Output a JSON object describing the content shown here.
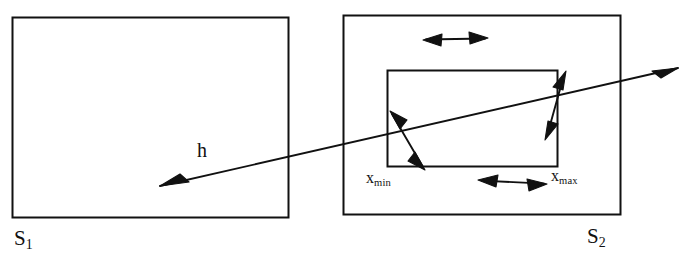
{
  "figure": {
    "type": "diagram",
    "background_color": "#ffffff",
    "stroke_color": "#111111",
    "width": 695,
    "height": 262
  },
  "labels": {
    "s1": {
      "base": "S",
      "subscript": "1"
    },
    "s2": {
      "base": "S",
      "subscript": "2"
    },
    "h": "h",
    "x_min": {
      "base": "x",
      "subscript": "min"
    },
    "x_max": {
      "base": "x",
      "subscript": "max"
    }
  },
  "shapes": {
    "outer_rect_left": {
      "x": 12,
      "y": 17,
      "width": 276,
      "height": 200
    },
    "outer_rect_right": {
      "x": 343,
      "y": 15,
      "width": 277,
      "height": 199
    },
    "inner_rect": {
      "x": 387,
      "y": 70,
      "width": 170,
      "height": 96
    }
  },
  "arrows": {
    "mapping_arrow_h": {
      "name": "h",
      "from": {
        "x": 678,
        "y": 68
      },
      "to": {
        "x": 160,
        "y": 186
      },
      "heads": "both",
      "description": "long diagonal arrow spanning from right of S2 to inside S1"
    },
    "top_double_arrow": {
      "from": {
        "x": 424,
        "y": 40
      },
      "to": {
        "x": 487,
        "y": 38
      },
      "heads": "both",
      "orientation": "horizontal"
    },
    "bottom_double_arrow": {
      "from": {
        "x": 479,
        "y": 180
      },
      "to": {
        "x": 546,
        "y": 184
      },
      "heads": "both",
      "orientation": "horizontal"
    },
    "left_diagonal_double_arrow": {
      "from": {
        "x": 390,
        "y": 112
      },
      "to": {
        "x": 425,
        "y": 169
      },
      "heads": "both",
      "orientation": "diagonal"
    },
    "right_diagonal_double_arrow": {
      "from": {
        "x": 566,
        "y": 72
      },
      "to": {
        "x": 545,
        "y": 139
      },
      "heads": "both",
      "orientation": "diagonal"
    }
  }
}
